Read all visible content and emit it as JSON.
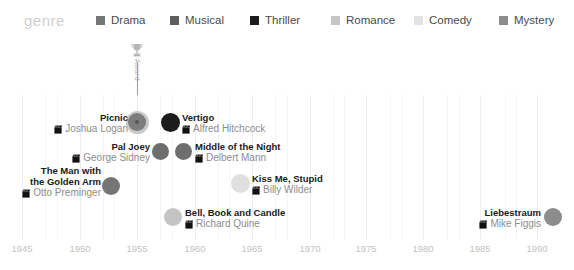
{
  "legend": {
    "title": "genre",
    "items": [
      {
        "label": "Drama",
        "color": "#757575",
        "x": 96
      },
      {
        "label": "Musical",
        "color": "#5e5e5e",
        "x": 170
      },
      {
        "label": "Thriller",
        "color": "#1c1c1c",
        "x": 250
      },
      {
        "label": "Romance",
        "color": "#c6c6c6",
        "x": 331
      },
      {
        "label": "Comedy",
        "color": "#e2e2e2",
        "x": 414
      },
      {
        "label": "Mystery",
        "color": "#8c8c8c",
        "x": 499
      }
    ]
  },
  "marker": {
    "icon": "trophy-icon",
    "label": "Award",
    "year": 1955
  },
  "axis": {
    "ticks": [
      "1945",
      "1950",
      "1955",
      "1960",
      "1965",
      "1970",
      "1975",
      "1980",
      "1985",
      "1990"
    ],
    "tick_x": [
      22,
      80,
      137,
      195,
      252,
      310,
      366,
      423,
      480,
      537
    ],
    "min": 1943,
    "max": 1992
  },
  "chart_data": {
    "type": "scatter",
    "title": "",
    "xlabel": "",
    "ylabel": "",
    "xlim": [
      1943,
      1992
    ],
    "grid": true,
    "legend_position": "top",
    "legend_title": "genre",
    "series": [
      {
        "name": "Drama",
        "color": "#757575"
      },
      {
        "name": "Musical",
        "color": "#5e5e5e"
      },
      {
        "name": "Thriller",
        "color": "#1c1c1c"
      },
      {
        "name": "Romance",
        "color": "#c6c6c6"
      },
      {
        "name": "Comedy",
        "color": "#e2e2e2"
      },
      {
        "name": "Mystery",
        "color": "#8c8c8c"
      }
    ],
    "points": [
      {
        "title": "Picnic",
        "director": "Joshua Logan",
        "year": 1955,
        "genre": "Drama",
        "color": "#7d7d7d",
        "cx": 137,
        "cy": 122,
        "r": 9,
        "label_side": "right",
        "ring": true
      },
      {
        "title": "Vertigo",
        "director": "Alfred Hitchcock",
        "year": 1958,
        "genre": "Thriller",
        "color": "#1c1c1c",
        "cx": 170,
        "cy": 122,
        "r": 9.5,
        "label_side": "left",
        "ring": false
      },
      {
        "title": "Pal Joey",
        "director": "George Sidney",
        "year": 1957,
        "genre": "Musical",
        "color": "#6e6e6e",
        "cx": 160,
        "cy": 151,
        "r": 8.5,
        "label_side": "right",
        "ring": false
      },
      {
        "title": "Middle of the Night",
        "director": "Delbert Mann",
        "year": 1959,
        "genre": "Drama",
        "color": "#6e6e6e",
        "cx": 183,
        "cy": 151,
        "r": 8.5,
        "label_side": "left",
        "ring": false
      },
      {
        "title": "The Man with\nthe Golden Arm",
        "director": "Otto Preminger",
        "year": 1955,
        "genre": "Drama",
        "color": "#757575",
        "cx": 111,
        "cy": 186,
        "r": 9,
        "label_side": "right",
        "ring": false
      },
      {
        "title": "Kiss Me, Stupid",
        "director": "Billy Wilder",
        "year": 1964,
        "genre": "Comedy",
        "color": "#e0e0e0",
        "cx": 240,
        "cy": 183,
        "r": 9.5,
        "label_side": "left",
        "ring": false
      },
      {
        "title": "Bell, Book and Candle",
        "director": "Richard Quine",
        "year": 1958,
        "genre": "Romance",
        "color": "#c4c4c4",
        "cx": 173,
        "cy": 217,
        "r": 9,
        "label_side": "left",
        "ring": false
      },
      {
        "title": "Liebestraum",
        "director": "Mike Figgis",
        "year": 1991,
        "genre": "Mystery",
        "color": "#8c8c8c",
        "cx": 553,
        "cy": 217,
        "r": 9,
        "label_side": "right",
        "ring": false
      }
    ]
  },
  "films": [
    {
      "title_lines": [
        "Picnic"
      ],
      "director": "Joshua Logan",
      "side": "right",
      "label_x": 128,
      "label_y": 112
    },
    {
      "title_lines": [
        "Vertigo"
      ],
      "director": "Alfred Hitchcock",
      "side": "left",
      "label_x": 182,
      "label_y": 112
    },
    {
      "title_lines": [
        "Pal Joey"
      ],
      "director": "George Sidney",
      "side": "right",
      "label_x": 150,
      "label_y": 141
    },
    {
      "title_lines": [
        "Middle of the Night"
      ],
      "director": "Delbert Mann",
      "side": "left",
      "label_x": 195,
      "label_y": 141
    },
    {
      "title_lines": [
        "The Man with",
        "the Golden Arm"
      ],
      "director": "Otto Preminger",
      "side": "right",
      "label_x": 101,
      "label_y": 165
    },
    {
      "title_lines": [
        "Kiss Me, Stupid"
      ],
      "director": "Billy Wilder",
      "side": "left",
      "label_x": 252,
      "label_y": 173
    },
    {
      "title_lines": [
        "Bell, Book and Candle"
      ],
      "director": "Richard Quine",
      "side": "left",
      "label_x": 185,
      "label_y": 207
    },
    {
      "title_lines": [
        "Liebestraum"
      ],
      "director": "Mike Figgis",
      "side": "right",
      "label_x": 541,
      "label_y": 207
    }
  ],
  "gridlines_major_x": [
    22,
    80,
    137,
    195,
    252,
    310,
    366,
    423,
    480,
    537
  ],
  "gridlines_minor_x": [
    45,
    57,
    103,
    114,
    160,
    172,
    218,
    229,
    275,
    287,
    333,
    344,
    390,
    402,
    447,
    459,
    505,
    516
  ]
}
